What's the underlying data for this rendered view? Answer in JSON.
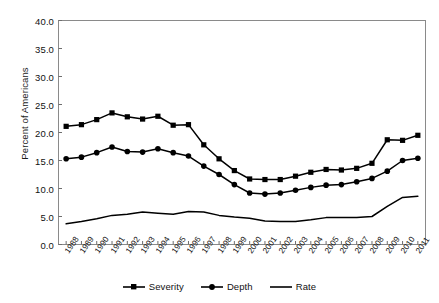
{
  "chart_data": {
    "type": "line",
    "title": "",
    "xlabel": "",
    "ylabel": "Percent of Americans",
    "ylim": [
      0.0,
      40.0
    ],
    "yticks": [
      "0.0",
      "5.0",
      "10.0",
      "15.0",
      "20.0",
      "25.0",
      "30.0",
      "35.0",
      "40.0"
    ],
    "ytick_values": [
      0.0,
      5.0,
      10.0,
      15.0,
      20.0,
      25.0,
      30.0,
      35.0,
      40.0
    ],
    "grid": false,
    "legend_position": "bottom-center",
    "categories": [
      "1988",
      "1989",
      "1990",
      "1991",
      "1992",
      "1993",
      "1994",
      "1995",
      "1996",
      "1997",
      "1998",
      "1999",
      "2000",
      "2001",
      "2002",
      "2003",
      "2004",
      "2005",
      "2006",
      "2007",
      "2008",
      "2009",
      "2010",
      "2011"
    ],
    "series": [
      {
        "name": "Severity",
        "marker": "square",
        "color": "#000000",
        "values": [
          21.1,
          21.4,
          22.3,
          23.5,
          22.8,
          22.4,
          22.9,
          21.3,
          21.4,
          17.8,
          15.3,
          13.2,
          11.7,
          11.6,
          11.6,
          12.2,
          12.9,
          13.4,
          13.3,
          13.6,
          14.5,
          18.7,
          18.6,
          19.5
        ]
      },
      {
        "name": "Depth",
        "marker": "circle",
        "color": "#000000",
        "values": [
          15.3,
          15.6,
          16.4,
          17.4,
          16.6,
          16.5,
          17.1,
          16.4,
          15.8,
          14.0,
          12.5,
          10.7,
          9.2,
          9.0,
          9.2,
          9.7,
          10.2,
          10.6,
          10.7,
          11.2,
          11.8,
          13.1,
          15.0,
          15.4
        ]
      },
      {
        "name": "Rate",
        "marker": "none",
        "color": "#000000",
        "values": [
          3.7,
          4.1,
          4.6,
          5.2,
          5.4,
          5.8,
          5.6,
          5.4,
          5.9,
          5.8,
          5.2,
          4.9,
          4.7,
          4.2,
          4.1,
          4.1,
          4.4,
          4.8,
          4.8,
          4.8,
          5.0,
          6.8,
          8.4,
          8.6
        ]
      }
    ]
  },
  "legend": {
    "items": [
      {
        "label": "Severity",
        "marker": "square"
      },
      {
        "label": "Depth",
        "marker": "circle"
      },
      {
        "label": "Rate",
        "marker": "line"
      }
    ]
  }
}
